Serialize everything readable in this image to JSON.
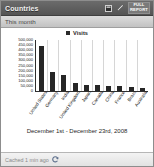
{
  "widget": {
    "title": "Countries",
    "period_label": "This month",
    "full_report_line1": "FULL",
    "full_report_line2": "REPORT",
    "table_icon": "table-view-icon",
    "edit_icon": "pencil-edit-icon",
    "refresh_icon": "refresh-icon",
    "footer_text": "Cached 1 min ago"
  },
  "chart_data": {
    "type": "bar",
    "title": "",
    "subtitle": "December 1st - December 23rd, 2008",
    "xlabel": "",
    "ylabel": "",
    "legend": [
      "Visits"
    ],
    "legend_position": "top-center",
    "grid": true,
    "ylim": [
      0,
      500000
    ],
    "ytick_labels": [
      "500,000",
      "450,000",
      "400,000",
      "350,000",
      "300,000",
      "250,000",
      "200,000",
      "150,000",
      "100,000",
      "50,000",
      "0"
    ],
    "ytick_values": [
      500000,
      450000,
      400000,
      350000,
      300000,
      250000,
      200000,
      150000,
      100000,
      50000,
      0
    ],
    "categories": [
      "United States",
      "Germany",
      "India",
      "United Kingdom",
      "Japan",
      "Canada",
      "China",
      "France",
      "Brazil",
      "Australia"
    ],
    "values": [
      440000,
      190000,
      160000,
      75000,
      62000,
      58000,
      52000,
      48000,
      40000,
      30000
    ],
    "series": [
      {
        "name": "Visits",
        "color": "#262626",
        "values": [
          440000,
          190000,
          160000,
          75000,
          62000,
          58000,
          52000,
          48000,
          40000,
          30000
        ]
      }
    ]
  },
  "colors": {
    "titlebar": "#5d5d5d",
    "subbar": "#cfcfcf",
    "bar": "#262626",
    "footer": "#ececec",
    "frame": "#8d8d8d"
  }
}
